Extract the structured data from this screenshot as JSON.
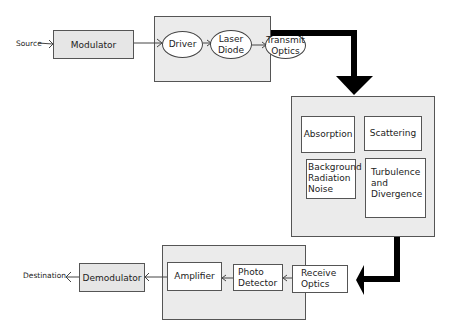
{
  "transmitter": {
    "source_label": "Source",
    "modulator_label": "Modulator",
    "driver_label": "Driver",
    "laser_diode_label": "Laser Diode",
    "transmit_optics_label": "Transmit Optics"
  },
  "channel": {
    "absorption_label": "Absorption",
    "scattering_label": "Scattering",
    "background_noise_label": "Background Radiation Noise",
    "turbulence_label": "Turbulence and Divergence"
  },
  "receiver": {
    "receive_optics_label": "Receive Optics",
    "photo_detector_label": "Photo Detector",
    "amplifier_label": "Amplifier",
    "demodulator_label": "Demodulator",
    "destination_label": "Destination"
  },
  "colors": {
    "block_fill": "#e8e8e8",
    "inner_fill": "#ffffff",
    "arrow": "#000000"
  }
}
